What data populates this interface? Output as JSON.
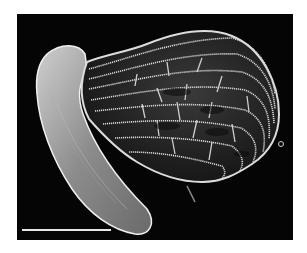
{
  "image": {
    "type": "scanning-electron-micrograph",
    "subject": "seed with reticulate (net-like) seed coat and elongated embryo",
    "background_color": "#050505",
    "frame_color": "#ffffff",
    "subject_color": "#d9d9d9"
  },
  "scale_bar": {
    "label": "",
    "color": "#e8e8e8",
    "x": 5,
    "y": 215,
    "length_px": 89
  }
}
